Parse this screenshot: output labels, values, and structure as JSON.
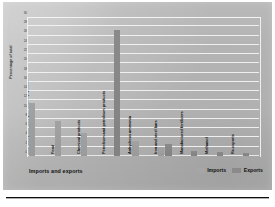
{
  "chart_data": {
    "type": "bar",
    "title": "",
    "xlabel": "Imports and exports",
    "ylabel": "Percentage of total",
    "ylim": [
      0,
      30
    ],
    "grid": true,
    "legend_position": "bottom-right",
    "ytick_labels": [
      "0",
      "2",
      "4",
      "6",
      "8",
      "10",
      "12",
      "14",
      "16",
      "18",
      "20",
      "22",
      "24",
      "26",
      "28",
      "30"
    ],
    "ytick_values": [
      0,
      2,
      4,
      6,
      8,
      10,
      12,
      14,
      16,
      18,
      20,
      22,
      24,
      26,
      28,
      30
    ],
    "categories": [
      "Machinery and transportation equipment",
      "Food",
      "Chemical products",
      "Petroleum and petroleum products",
      "Anhydrous ammonia",
      "Iron and steel bars",
      "Manufactured fertilizers",
      "Methanol",
      "Re-exports"
    ],
    "series": [
      {
        "name": "Imports",
        "color": "#a2a2a2",
        "values": [
          11.4,
          7.6,
          5.0,
          0.0,
          3.2,
          1.9,
          0.0,
          0.0,
          0.0
        ]
      },
      {
        "name": "Exports",
        "color": "#8a8a8a",
        "values": [
          0.0,
          0.0,
          0.0,
          27.2,
          0.0,
          2.6,
          1.0,
          0.9,
          0.6
        ]
      }
    ]
  },
  "axes": {
    "y_title": "Percentage of total",
    "x_title": "Imports and exports"
  },
  "legend": {
    "items": [
      {
        "label": "Imports",
        "swatch": "legend-swatch-imports"
      },
      {
        "label": "Exports",
        "swatch": "legend-swatch-exports"
      }
    ]
  },
  "colors": {
    "imports": "#a2a2a2",
    "exports": "#8a8a8a",
    "gridline": "#f2f2f2",
    "panel": "#b5b5b5",
    "text": "#111111"
  }
}
